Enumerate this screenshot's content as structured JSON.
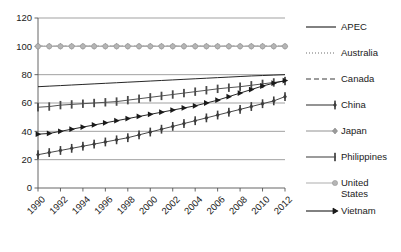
{
  "chart_data": {
    "type": "line",
    "title": "",
    "subtitle": "",
    "xlabel": "",
    "ylabel": "",
    "xlim": [
      1990,
      2012
    ],
    "ylim": [
      0,
      120
    ],
    "yticks": [
      0,
      20,
      40,
      60,
      80,
      100,
      120
    ],
    "xticks": [
      1990,
      1992,
      1994,
      1996,
      1998,
      2000,
      2002,
      2004,
      2006,
      2008,
      2010,
      2012
    ],
    "x": [
      1990,
      1991,
      1992,
      1993,
      1994,
      1995,
      1996,
      1997,
      1998,
      1999,
      2000,
      2001,
      2002,
      2003,
      2004,
      2005,
      2006,
      2007,
      2008,
      2009,
      2010,
      2011,
      2012
    ],
    "grid": "horizontal",
    "legend_position": "right",
    "series": [
      {
        "name": "APEC",
        "color": "#1a1a1a",
        "style": "solid",
        "marker": "none",
        "values": [
          71.5,
          71.9,
          72.3,
          72.7,
          73.1,
          73.5,
          73.9,
          74.3,
          74.7,
          75.1,
          75.5,
          75.9,
          76.3,
          76.7,
          77.1,
          77.5,
          77.9,
          78.3,
          78.7,
          79.1,
          79.4,
          79.7,
          80.0
        ]
      },
      {
        "name": "Australia",
        "color": "#6e6e6e",
        "style": "dotted",
        "marker": "none",
        "values": [
          100,
          100,
          100,
          100,
          100,
          100,
          100,
          100,
          100,
          100,
          100,
          100,
          100,
          100,
          100,
          100,
          100,
          100,
          100,
          100,
          100,
          100,
          100
        ]
      },
      {
        "name": "Canada",
        "color": "#3a3a3a",
        "style": "dashed",
        "marker": "none",
        "values": [
          100,
          100,
          100,
          100,
          100,
          100,
          100,
          100,
          100,
          100,
          100,
          100,
          100,
          100,
          100,
          100,
          100,
          100,
          100,
          100,
          100,
          100,
          100
        ]
      },
      {
        "name": "China",
        "color": "#3d3d3d",
        "style": "solid",
        "marker": "diamond-bar",
        "values": [
          23.5,
          25.0,
          26.5,
          28.0,
          29.5,
          31.0,
          32.5,
          34.0,
          35.5,
          37.5,
          39.5,
          41.5,
          43.5,
          45.5,
          47.5,
          49.5,
          51.5,
          53.5,
          55.5,
          57.5,
          59.5,
          61.5,
          64.5
        ]
      },
      {
        "name": "Japan",
        "color": "#9b9b9b",
        "style": "solid",
        "marker": "diamond",
        "values": [
          100,
          100,
          100,
          100,
          100,
          100,
          100,
          100,
          100,
          100,
          100,
          100,
          100,
          100,
          100,
          100,
          100,
          100,
          100,
          100,
          100,
          100,
          100
        ]
      },
      {
        "name": "Philippines",
        "color": "#4a4a4a",
        "style": "solid",
        "marker": "bar",
        "values": [
          57.0,
          57.5,
          58.5,
          59.0,
          59.5,
          60.0,
          60.5,
          61.0,
          62.0,
          63.0,
          64.0,
          65.0,
          66.0,
          67.0,
          68.0,
          69.0,
          70.0,
          70.8,
          71.5,
          72.5,
          73.5,
          74.5,
          75.5
        ]
      },
      {
        "name": "United States",
        "color": "#b5b5b5",
        "style": "solid",
        "marker": "circle",
        "values": [
          100,
          100,
          100,
          100,
          100,
          100,
          100,
          100,
          100,
          100,
          100,
          100,
          100,
          100,
          100,
          100,
          100,
          100,
          100,
          100,
          100,
          100,
          100
        ]
      },
      {
        "name": "Vietnam",
        "color": "#1a1a1a",
        "style": "solid",
        "marker": "triangle",
        "values": [
          38.0,
          38.5,
          40.0,
          41.5,
          43.0,
          44.5,
          46.0,
          47.5,
          49.0,
          50.5,
          52.0,
          53.5,
          55.0,
          56.5,
          58.0,
          60.0,
          62.0,
          64.5,
          67.0,
          69.5,
          72.0,
          74.0,
          75.8
        ]
      }
    ]
  },
  "axis": {
    "ylabels": [
      "120",
      "100",
      "80",
      "60",
      "40",
      "20",
      "0"
    ],
    "xlabels": [
      "1990",
      "1992",
      "1994",
      "1996",
      "1998",
      "2000",
      "2002",
      "2004",
      "2006",
      "2008",
      "2010",
      "2012"
    ]
  },
  "legend": {
    "items": [
      {
        "label": "APEC",
        "icon": "line-solid-icon"
      },
      {
        "label": "Australia",
        "icon": "line-dotted-icon"
      },
      {
        "label": "Canada",
        "icon": "line-dashed-icon"
      },
      {
        "label": "China",
        "icon": "line-diamond-bar-marker-icon"
      },
      {
        "label": "Japan",
        "icon": "line-diamond-marker-icon"
      },
      {
        "label": "Philippines",
        "icon": "line-bar-marker-icon"
      },
      {
        "label": "United States",
        "icon": "line-circle-marker-icon"
      },
      {
        "label": "Vietnam",
        "icon": "line-arrow-marker-icon"
      }
    ]
  }
}
